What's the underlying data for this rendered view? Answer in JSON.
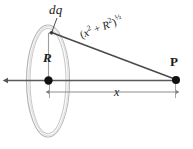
{
  "figure": {
    "background_color": "#ffffff",
    "width": 193,
    "height": 149,
    "labels": {
      "charge_element": "dq",
      "radius": "R",
      "axial_distance": "x",
      "field_point": "P",
      "distance_expression": {
        "open_paren": "(",
        "x_base": "x",
        "x_exponent": "2",
        "plus": " + ",
        "r_base": "R",
        "r_exponent": "2",
        "close_paren": ")",
        "outer_exponent": "½",
        "plain_text": "(x2 + R2)½"
      }
    },
    "colors": {
      "ring_outline": "#b8b8b8",
      "ring_inner": "#d8d8d8",
      "axis_line": "#555555",
      "hypotenuse_line": "#4a4a4a",
      "dimension_line": "#8a8a8a",
      "radius_line": "#9a9a9a",
      "point_marker": "#111111",
      "leader_line": "#333333",
      "text": "#1a1a1a"
    },
    "geometry": {
      "ring_center": {
        "x": 48,
        "y": 81
      },
      "ring_radius_x": 21,
      "ring_radius_y": 55,
      "ring_top_point": {
        "x": 51,
        "y": 32
      },
      "field_point_P": {
        "x": 176,
        "y": 80
      },
      "axis_left_end": {
        "x": 7,
        "y": 80
      },
      "dimension_line_y": 92,
      "dimension_start_x": 49,
      "dimension_end_x": 176
    }
  }
}
